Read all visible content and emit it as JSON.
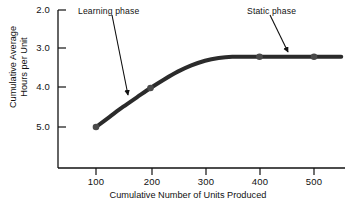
{
  "chart_data": {
    "type": "line",
    "title": "",
    "xlabel": "Cumulative Number of Units Produced",
    "ylabel_line1": "Cumulative Average",
    "ylabel_line2": "Hours per Unit",
    "ylabel": "Cumulative Average Hours per Unit",
    "x_ticks": [
      100,
      200,
      300,
      400,
      500
    ],
    "x_tick_labels": [
      "100",
      "200",
      "300",
      "400",
      "500"
    ],
    "y_ticks": [
      2.0,
      3.0,
      4.0,
      5.0
    ],
    "y_tick_labels": [
      "2.0",
      "3.0",
      "4.0",
      "5.0"
    ],
    "xlim": [
      50,
      550
    ],
    "ylim": [
      5.3,
      1.85
    ],
    "y_axis_inverted": true,
    "grid": false,
    "legend": "none",
    "series": [
      {
        "name": "Cumulative average hours per unit",
        "x": [
          100,
          125,
          150,
          175,
          200,
          225,
          250,
          275,
          300,
          325,
          350,
          400,
          450,
          500,
          550
        ],
        "values": [
          5.0,
          4.74,
          4.48,
          4.24,
          4.0,
          3.78,
          3.58,
          3.42,
          3.3,
          3.23,
          3.2,
          3.2,
          3.2,
          3.2,
          3.2
        ],
        "marker_points": [
          {
            "x": 100,
            "y": 5.0
          },
          {
            "x": 200,
            "y": 4.0
          },
          {
            "x": 400,
            "y": 3.2
          },
          {
            "x": 500,
            "y": 3.2
          }
        ],
        "color": "#2b2b2b",
        "line_width": 4
      }
    ],
    "annotations": [
      {
        "text": "Learning phase",
        "label_x": 78,
        "label_y": 6,
        "arrow_from_x": 112,
        "arrow_from_y": 15,
        "arrow_to_x": 128,
        "arrow_to_y": 97
      },
      {
        "text": "Static phase",
        "label_x": 247,
        "label_y": 6,
        "arrow_from_x": 270,
        "arrow_from_y": 15,
        "arrow_to_x": 289,
        "arrow_to_y": 54
      }
    ],
    "colors": {
      "background": "#ffffff",
      "axis": "#111111",
      "curve": "#2b2b2b",
      "text": "#111111"
    }
  },
  "axis_geometry": {
    "y_tick_positions_px": [
      10,
      48,
      87,
      127
    ],
    "x_tick_positions_px": [
      96,
      152,
      206,
      260,
      314
    ],
    "axis_x_px": 58,
    "axis_y_px": 168,
    "axis_top_px": 10,
    "axis_right_px": 345
  }
}
